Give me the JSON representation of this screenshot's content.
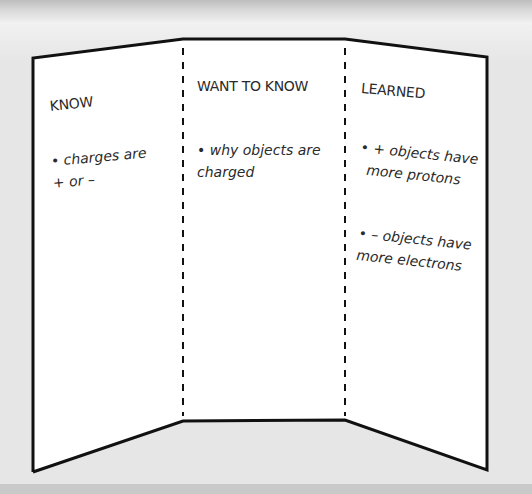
{
  "diagram": {
    "type": "tri-fold-board",
    "panels": [
      {
        "heading": "KNOW",
        "notes": [
          {
            "line1": "• charges are",
            "line2": "+ or –"
          }
        ]
      },
      {
        "heading": "WANT TO KNOW",
        "notes": [
          {
            "line1": "• why objects are",
            "line2": "charged"
          }
        ]
      },
      {
        "heading": "LEARNED",
        "notes": [
          {
            "line1": "• + objects have",
            "line2": "more protons"
          },
          {
            "line1": "• – objects have",
            "line2": "more electrons"
          }
        ]
      }
    ],
    "colors": {
      "outline": "#111111",
      "board_fill": "#ffffff",
      "background": "#e6e6e6",
      "text": "#2a2a2a"
    }
  }
}
